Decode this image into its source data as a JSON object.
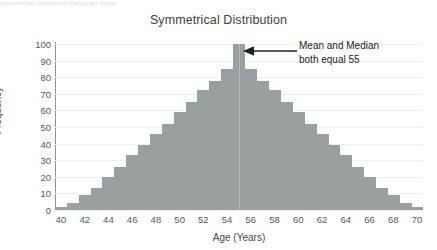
{
  "artifact_text": "symmetrical distribution histogram figure",
  "chart_data": {
    "type": "bar",
    "title": "Symmetrical Distribution",
    "xlabel": "Age (Years)",
    "ylabel": "Frequency",
    "xlim": [
      40,
      70
    ],
    "ylim": [
      0,
      100
    ],
    "grid": true,
    "legend_position": "none",
    "bar_color": "#9a9fa2",
    "axis_color": "#8d9296",
    "gridline_color": "#eceef0",
    "text_color": "#3a3f42",
    "categories": [
      40,
      41,
      42,
      43,
      44,
      45,
      46,
      47,
      48,
      49,
      50,
      51,
      52,
      53,
      54,
      55,
      56,
      57,
      58,
      59,
      60,
      61,
      62,
      63,
      64,
      65,
      66,
      67,
      68,
      69,
      70
    ],
    "values": [
      2,
      4,
      9,
      13,
      20,
      26,
      33,
      39,
      46,
      52,
      59,
      65,
      72,
      78,
      85,
      100,
      85,
      78,
      72,
      65,
      59,
      52,
      46,
      39,
      33,
      26,
      20,
      13,
      9,
      4,
      2
    ],
    "xticks": [
      40,
      42,
      44,
      46,
      48,
      50,
      52,
      54,
      56,
      58,
      60,
      62,
      64,
      66,
      68,
      70
    ],
    "yticks": [
      0,
      10,
      20,
      30,
      40,
      50,
      60,
      70,
      80,
      90,
      100
    ],
    "annotations": [
      {
        "id": "mean-median-callout",
        "line1": "Mean and Median",
        "line2": "both equal 55",
        "points_to_x": 55,
        "points_to_y": 100,
        "arrow": "left-arrow"
      }
    ],
    "center_marker": {
      "x": 55,
      "color": "#b4b8bb"
    }
  }
}
